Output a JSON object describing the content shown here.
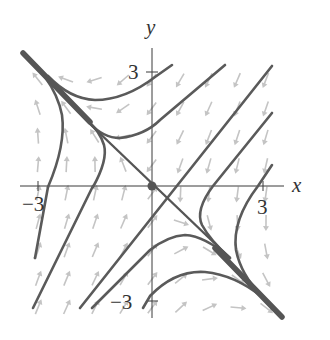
{
  "figure": {
    "type": "phase-portrait",
    "axes": {
      "x_label": "x",
      "y_label": "y",
      "x_ticks": [
        {
          "value": -3,
          "label": "−3"
        },
        {
          "value": 3,
          "label": "3"
        }
      ],
      "y_ticks": [
        {
          "value": 3,
          "label": "3"
        },
        {
          "value": -3,
          "label": "−3"
        }
      ],
      "range": [
        -3.5,
        3.5
      ]
    },
    "equilibrium": {
      "x": 0,
      "y": 0,
      "label": "origin"
    },
    "separatrix": {
      "direction": [
        1,
        -1
      ],
      "description": "line y = -x"
    },
    "straight_trajectories_slope": 1,
    "colors": {
      "trajectory": "#5a5a5a",
      "vector_field": "#c4c4c4",
      "axes": "#3a3a3a",
      "background": "#ffffff"
    }
  }
}
